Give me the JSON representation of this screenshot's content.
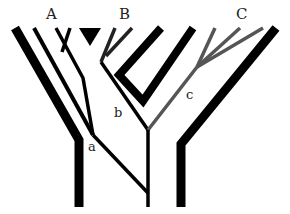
{
  "diagram": {
    "type": "cladogram",
    "taxa_labels": {
      "A": "A",
      "B": "B",
      "C": "C"
    },
    "node_labels": {
      "a": "a",
      "b": "b",
      "c": "c"
    },
    "colors": {
      "black": "#000000",
      "gray": "#555555",
      "background": "#ffffff"
    }
  }
}
